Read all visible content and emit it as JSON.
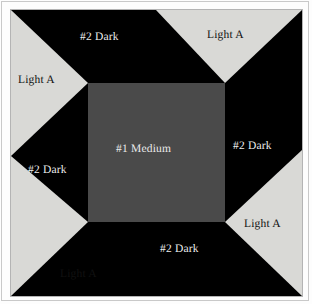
{
  "figure": {
    "background_color": "#fdfdfd",
    "frame_color": "#c9c9c9"
  },
  "block": {
    "name": "quilt-block",
    "background_color": "#000000",
    "x": 11,
    "y": 10,
    "width": 291,
    "height": 286,
    "center_square": {
      "name": "#1 Medium",
      "color": "#4a4a4a",
      "x": 77,
      "y": 73,
      "width": 137,
      "height": 139
    },
    "light_triangles": {
      "name": "Light A",
      "color": "#d9d9d6",
      "count": 4
    },
    "dark_field": {
      "name": "#2 Dark",
      "color": "#000000"
    }
  },
  "labels": {
    "top_dark": "#2 Dark",
    "top_light": "Light A",
    "left_light": "Light A",
    "right_dark": "#2 Dark",
    "left_dark": "#2 Dark",
    "center_medium": "#1 Medium",
    "right_light": "Light A",
    "bottom_dark": "#2 Dark",
    "bottom_light": "Light A"
  },
  "legend": {
    "pieces": [
      {
        "label": "#1 Medium",
        "color": "#4a4a4a",
        "count": 1
      },
      {
        "label": "#2 Dark",
        "color": "#000000",
        "count": 4
      },
      {
        "label": "Light A",
        "color": "#d9d9d6",
        "count": 4
      }
    ]
  }
}
